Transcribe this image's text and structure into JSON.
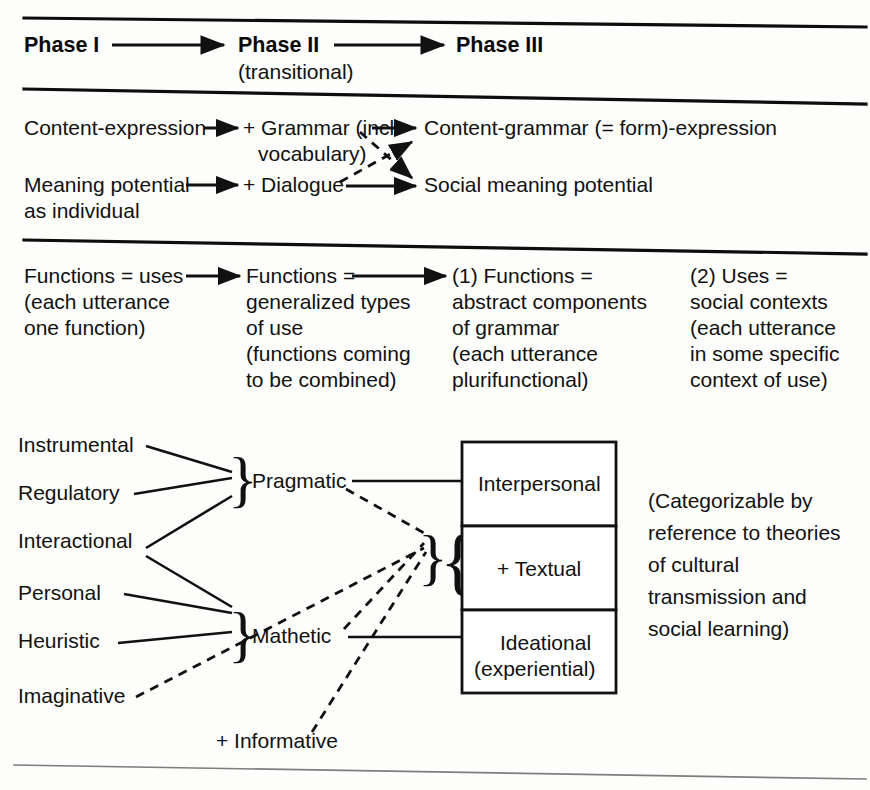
{
  "figure": {
    "type": "diagram"
  },
  "phases": {
    "phase1": "Phase I",
    "phase2": "Phase II",
    "phase2_sub": "(transitional)",
    "phase3": "Phase III"
  },
  "section2": {
    "left_top": "Content-expression",
    "left_bottom_l1": "Meaning potential",
    "left_bottom_l2": "as individual",
    "mid_top_l1": "+ Grammar (incl.",
    "mid_top_l2": "vocabulary)",
    "mid_bottom": "+ Dialogue",
    "right_top": "Content-grammar (= form)-expression",
    "right_bottom": "Social meaning potential"
  },
  "section3": {
    "col1": [
      "Functions = uses",
      "(each utterance",
      "one function)"
    ],
    "col2": [
      "Functions =",
      "generalized types",
      "of use",
      "(functions coming",
      "to be combined)"
    ],
    "col3": [
      "(1) Functions =",
      "abstract components",
      "of grammar",
      "(each utterance",
      "plurifunctional)"
    ],
    "col4": [
      "(2) Uses =",
      "social contexts",
      "(each utterance",
      "in some specific",
      "context of use)"
    ]
  },
  "section4": {
    "micro_functions": [
      "Instrumental",
      "Regulatory",
      "Interactional",
      "Personal",
      "Heuristic",
      "Imaginative"
    ],
    "informative": "+ Informative",
    "macro_functions": [
      "Pragmatic",
      "Mathetic"
    ],
    "metafunctions": [
      "Interpersonal",
      "+ Textual",
      "Ideational",
      "(experiential)"
    ],
    "note": [
      "(Categorizable by",
      "reference to theories",
      "of cultural",
      "transmission and",
      "social learning)"
    ]
  },
  "glyphs": {
    "brace": "}",
    "brace_open": "{"
  },
  "colors": {
    "ink": "#111111",
    "page": "#fdfdfc",
    "rule": "#0d0d0d",
    "rule_faint": "#7d7d7d"
  }
}
